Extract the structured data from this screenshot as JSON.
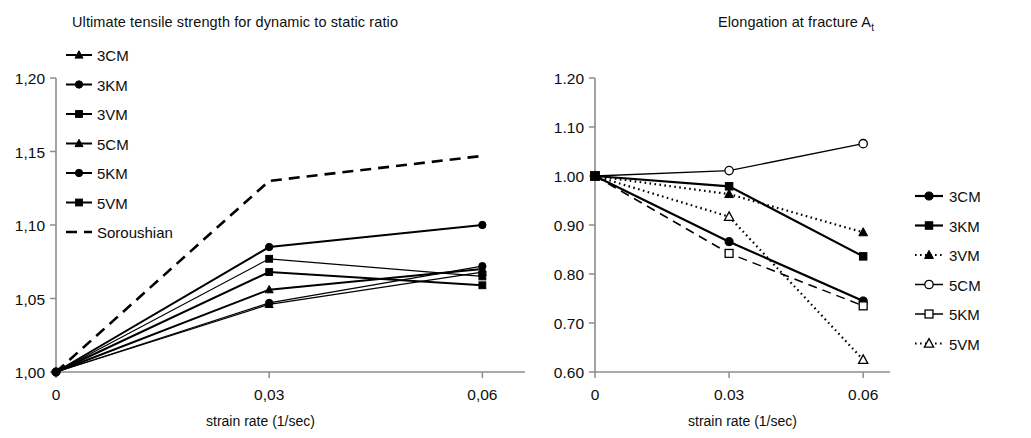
{
  "figure": {
    "panels": [
      "ultimate-tensile-strength",
      "elongation-at-fracture"
    ]
  },
  "left": {
    "title": "Ultimate tensile strength for dynamic to static ratio",
    "xlabel": "strain rate (1/sec)",
    "ylabel": "",
    "ytick_labels": [
      "1,20",
      "1,15",
      "1,10",
      "1,05",
      "1,00"
    ],
    "xtick_labels": [
      "0",
      "0,03",
      "0,06"
    ],
    "legend": [
      {
        "label": "3CM",
        "marker": "triangle-filled",
        "dash": "solid"
      },
      {
        "label": "3KM",
        "marker": "circle-filled",
        "dash": "solid"
      },
      {
        "label": "3VM",
        "marker": "square-filled",
        "dash": "solid"
      },
      {
        "label": "5CM",
        "marker": "triangle-filled",
        "dash": "solid"
      },
      {
        "label": "5KM",
        "marker": "circle-filled",
        "dash": "solid"
      },
      {
        "label": "5VM",
        "marker": "square-filled",
        "dash": "solid"
      },
      {
        "label": "Soroushian",
        "marker": "none",
        "dash": "dashed"
      }
    ]
  },
  "right": {
    "title_main": "Elongation at fracture A",
    "title_sub": "t",
    "xlabel": "strain rate (1/sec)",
    "ylabel": "",
    "ytick_labels": [
      "1.20",
      "1.10",
      "1.00",
      "0.90",
      "0.80",
      "0.70",
      "0.60"
    ],
    "xtick_labels": [
      "0",
      "0.03",
      "0.06"
    ],
    "legend": [
      {
        "label": "3CM",
        "marker": "circle-filled",
        "dash": "solid"
      },
      {
        "label": "3KM",
        "marker": "square-filled",
        "dash": "solid"
      },
      {
        "label": "3VM",
        "marker": "triangle-filled",
        "dash": "dotted"
      },
      {
        "label": "5CM",
        "marker": "circle-open",
        "dash": "solid"
      },
      {
        "label": "5KM",
        "marker": "square-open",
        "dash": "dashed"
      },
      {
        "label": "5VM",
        "marker": "triangle-open",
        "dash": "dotted"
      }
    ]
  },
  "chart_data": [
    {
      "type": "line",
      "title": "Ultimate tensile strength for dynamic to static ratio",
      "xlabel": "strain rate (1/sec)",
      "ylabel": "",
      "x": [
        0,
        0.03,
        0.06
      ],
      "xlim": [
        0,
        0.066
      ],
      "ylim": [
        1.0,
        1.2
      ],
      "yticks": [
        1.0,
        1.05,
        1.1,
        1.15,
        1.2
      ],
      "xticks": [
        0,
        0.03,
        0.06
      ],
      "grid": false,
      "legend_position": "top-left-inside",
      "series": [
        {
          "name": "3CM",
          "marker": "triangle-filled",
          "dash": "solid",
          "values": [
            1.0,
            1.056,
            1.07
          ]
        },
        {
          "name": "3KM",
          "marker": "circle-filled",
          "dash": "solid",
          "values": [
            1.0,
            1.085,
            1.1
          ]
        },
        {
          "name": "3VM",
          "marker": "square-filled",
          "dash": "solid",
          "values": [
            1.0,
            1.068,
            1.059
          ]
        },
        {
          "name": "5CM",
          "marker": "triangle-filled",
          "dash": "solid",
          "values": [
            1.0,
            1.046,
            1.068
          ]
        },
        {
          "name": "5KM",
          "marker": "circle-filled",
          "dash": "solid",
          "values": [
            1.0,
            1.047,
            1.072
          ]
        },
        {
          "name": "5VM",
          "marker": "square-filled",
          "dash": "solid",
          "values": [
            1.0,
            1.077,
            1.065
          ]
        },
        {
          "name": "Soroushian",
          "marker": "none",
          "dash": "dashed",
          "values": [
            1.0,
            1.13,
            1.147
          ]
        }
      ]
    },
    {
      "type": "line",
      "title": "Elongation at fracture At",
      "xlabel": "strain rate (1/sec)",
      "ylabel": "",
      "x": [
        0,
        0.03,
        0.06
      ],
      "xlim": [
        0,
        0.066
      ],
      "ylim": [
        0.6,
        1.2
      ],
      "yticks": [
        0.6,
        0.7,
        0.8,
        0.9,
        1.0,
        1.1,
        1.2
      ],
      "xticks": [
        0,
        0.03,
        0.06
      ],
      "grid": false,
      "legend_position": "right-outside",
      "series": [
        {
          "name": "3CM",
          "marker": "circle-filled",
          "dash": "solid",
          "values": [
            1.0,
            0.866,
            0.745
          ]
        },
        {
          "name": "3KM",
          "marker": "square-filled",
          "dash": "solid",
          "values": [
            1.0,
            0.979,
            0.836
          ]
        },
        {
          "name": "3VM",
          "marker": "triangle-filled",
          "dash": "dotted",
          "values": [
            1.0,
            0.963,
            0.885
          ]
        },
        {
          "name": "5CM",
          "marker": "circle-open",
          "dash": "solid",
          "values": [
            1.0,
            1.011,
            1.066
          ]
        },
        {
          "name": "5KM",
          "marker": "square-open",
          "dash": "dashed",
          "values": [
            1.0,
            0.842,
            0.735
          ]
        },
        {
          "name": "5VM",
          "marker": "triangle-open",
          "dash": "dotted",
          "values": [
            1.0,
            0.917,
            0.625
          ]
        }
      ]
    }
  ]
}
